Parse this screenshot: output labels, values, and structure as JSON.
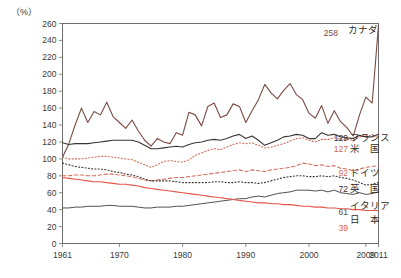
{
  "chart_data": {
    "type": "line",
    "title": "",
    "xlabel": "",
    "ylabel": "",
    "unit_label": "（%）",
    "xlim": [
      1961,
      2011
    ],
    "ylim": [
      0,
      260
    ],
    "ytick_step": 20,
    "grid": false,
    "legend_position": "right-inline-end-labels",
    "yticks": [
      0,
      20,
      40,
      60,
      80,
      100,
      120,
      140,
      160,
      180,
      200,
      220,
      240,
      260
    ],
    "xticks": [
      1961,
      1970,
      1980,
      1990,
      2000,
      2009,
      2011
    ],
    "xtick_labels": [
      "1961",
      "1970",
      "1980",
      "1990",
      "2000",
      "2009",
      "2011"
    ],
    "x": [
      1961,
      1962,
      1963,
      1964,
      1965,
      1966,
      1967,
      1968,
      1969,
      1970,
      1971,
      1972,
      1973,
      1974,
      1975,
      1976,
      1977,
      1978,
      1979,
      1980,
      1981,
      1982,
      1983,
      1984,
      1985,
      1986,
      1987,
      1988,
      1989,
      1990,
      1991,
      1992,
      1993,
      1994,
      1995,
      1996,
      1997,
      1998,
      1999,
      2000,
      2001,
      2002,
      2003,
      2004,
      2005,
      2006,
      2007,
      2008,
      2009,
      2010,
      2011
    ],
    "series": [
      {
        "name": "カナダ",
        "name_en": "Canada",
        "end_label": "258",
        "end_value": 258,
        "color": "#7a4a42",
        "style": "solid",
        "width": 1.1,
        "values": [
          102,
          118,
          140,
          160,
          143,
          156,
          152,
          167,
          150,
          143,
          136,
          146,
          133,
          122,
          115,
          124,
          120,
          118,
          131,
          128,
          155,
          152,
          139,
          162,
          166,
          149,
          152,
          165,
          162,
          143,
          157,
          170,
          188,
          178,
          171,
          181,
          189,
          176,
          170,
          154,
          148,
          163,
          142,
          157,
          144,
          137,
          127,
          152,
          173,
          166,
          258
        ]
      },
      {
        "name": "フランス",
        "name_en": "France",
        "end_label": "129",
        "end_value": 129,
        "color": "#3a3533",
        "style": "solid",
        "width": 1.1,
        "values": [
          119,
          117,
          118,
          118,
          118,
          119,
          120,
          121,
          122,
          122,
          122,
          122,
          120,
          116,
          112,
          112,
          113,
          114,
          115,
          114,
          117,
          119,
          120,
          122,
          123,
          122,
          124,
          127,
          129,
          124,
          127,
          122,
          116,
          119,
          122,
          126,
          127,
          129,
          128,
          124,
          124,
          131,
          128,
          129,
          126,
          125,
          124,
          128,
          126,
          126,
          129
        ]
      },
      {
        "name": "米　国",
        "name_en": "United States",
        "end_label": "127",
        "end_value": 127,
        "color": "#cf6a58",
        "style": "dotted",
        "width": 1.1,
        "values": [
          102,
          100,
          100,
          100,
          101,
          102,
          103,
          103,
          102,
          101,
          100,
          99,
          96,
          93,
          90,
          93,
          97,
          98,
          97,
          96,
          99,
          104,
          107,
          110,
          112,
          111,
          114,
          117,
          119,
          118,
          119,
          116,
          113,
          114,
          116,
          118,
          121,
          124,
          125,
          122,
          120,
          123,
          123,
          125,
          123,
          123,
          122,
          126,
          128,
          127,
          127
        ]
      },
      {
        "name": "ドイツ",
        "name_en": "Germany",
        "end_label": "92",
        "end_value": 92,
        "color": "#d4705e",
        "style": "dashed",
        "width": 1.1,
        "values": [
          80,
          80,
          81,
          81,
          80,
          80,
          81,
          82,
          82,
          81,
          80,
          79,
          77,
          75,
          74,
          75,
          76,
          77,
          78,
          78,
          79,
          80,
          81,
          82,
          83,
          84,
          85,
          86,
          87,
          85,
          87,
          86,
          85,
          87,
          88,
          89,
          90,
          92,
          95,
          94,
          92,
          93,
          91,
          92,
          89,
          88,
          86,
          88,
          90,
          91,
          92
        ]
      },
      {
        "name": "英　国",
        "name_en": "United Kingdom",
        "end_label": "72",
        "end_value": 72,
        "color": "#3a3533",
        "style": "dotted",
        "width": 1.1,
        "values": [
          95,
          93,
          91,
          90,
          89,
          88,
          88,
          87,
          85,
          84,
          82,
          81,
          79,
          76,
          74,
          74,
          74,
          74,
          73,
          72,
          72,
          72,
          72,
          72,
          73,
          73,
          72,
          72,
          73,
          72,
          72,
          71,
          72,
          74,
          76,
          78,
          79,
          80,
          80,
          79,
          79,
          80,
          79,
          80,
          78,
          77,
          75,
          72,
          69,
          70,
          72
        ]
      },
      {
        "name": "イタリア",
        "name_en": "Italy",
        "end_label": "61",
        "end_value": 61,
        "color": "#55504d",
        "style": "solid",
        "width": 1.0,
        "values": [
          42,
          42,
          43,
          43,
          44,
          44,
          44,
          45,
          45,
          44,
          44,
          44,
          43,
          42,
          42,
          43,
          43,
          43,
          44,
          44,
          45,
          46,
          47,
          48,
          49,
          50,
          51,
          52,
          53,
          53,
          55,
          56,
          55,
          57,
          59,
          60,
          61,
          63,
          63,
          63,
          62,
          63,
          61,
          63,
          60,
          59,
          58,
          60,
          58,
          59,
          61
        ]
      },
      {
        "name": "日　本",
        "name_en": "Japan",
        "end_label": "39",
        "end_value": 39,
        "color": "#e8564a",
        "style": "solid",
        "width": 1.1,
        "values": [
          78,
          77,
          76,
          75,
          74,
          73,
          73,
          72,
          71,
          70,
          70,
          69,
          68,
          66,
          65,
          64,
          63,
          62,
          61,
          60,
          59,
          58,
          57,
          56,
          55,
          54,
          53,
          52,
          51,
          50,
          49,
          48,
          48,
          47,
          47,
          46,
          46,
          45,
          44,
          44,
          43,
          43,
          42,
          42,
          41,
          41,
          40,
          40,
          39,
          39,
          39
        ]
      }
    ],
    "end_labels": [
      {
        "text": "258",
        "series": "カナダ"
      },
      {
        "text": "129",
        "series": "フランス"
      },
      {
        "text": "127",
        "series": "米　国"
      },
      {
        "text": "92",
        "series": "ドイツ"
      },
      {
        "text": "72",
        "series": "英　国"
      },
      {
        "text": "61",
        "series": "イタリア"
      },
      {
        "text": "39",
        "series": "日　本"
      }
    ]
  }
}
